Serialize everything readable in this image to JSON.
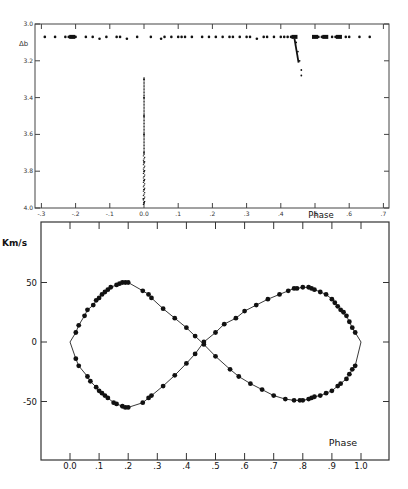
{
  "chart_data": [
    {
      "type": "scatter",
      "title": "",
      "xlabel": "Phase",
      "ylabel": "",
      "y_marker_label": "Δb",
      "xlim": [
        -0.3,
        0.7
      ],
      "ylim": [
        4.0,
        3.0
      ],
      "y_inverted": true,
      "x_ticks": [
        "-.3",
        "-.2",
        "-.1",
        "0.0",
        ".1",
        ".2",
        ".3",
        ".4",
        ".5",
        ".6",
        ".7"
      ],
      "y_ticks": [
        "3.0",
        "3.2",
        "3.4",
        "3.6",
        "3.8",
        "4.0"
      ],
      "grid": false,
      "series": [
        {
          "name": "out-of-eclipse",
          "x": [
            -0.29,
            -0.26,
            -0.23,
            -0.22,
            -0.21,
            -0.2,
            -0.17,
            -0.15,
            -0.13,
            -0.11,
            -0.08,
            -0.07,
            -0.05,
            -0.02,
            0.02,
            0.05,
            0.06,
            0.08,
            0.1,
            0.11,
            0.12,
            0.14,
            0.17,
            0.19,
            0.21,
            0.23,
            0.25,
            0.26,
            0.28,
            0.3,
            0.31,
            0.33,
            0.35,
            0.36,
            0.38,
            0.4,
            0.41,
            0.42,
            0.43,
            0.44,
            0.5,
            0.51,
            0.52,
            0.55,
            0.56,
            0.59,
            0.6,
            0.63,
            0.66
          ],
          "y": [
            3.07,
            3.07,
            3.07,
            3.07,
            3.07,
            3.07,
            3.07,
            3.07,
            3.08,
            3.07,
            3.07,
            3.07,
            3.08,
            3.07,
            3.07,
            3.08,
            3.07,
            3.07,
            3.07,
            3.07,
            3.07,
            3.07,
            3.07,
            3.07,
            3.07,
            3.07,
            3.07,
            3.07,
            3.07,
            3.07,
            3.07,
            3.08,
            3.07,
            3.07,
            3.07,
            3.07,
            3.07,
            3.07,
            3.07,
            3.07,
            3.07,
            3.07,
            3.07,
            3.07,
            3.07,
            3.07,
            3.07,
            3.07,
            3.07
          ]
        },
        {
          "name": "primary-eclipse",
          "x": [
            0.0,
            0.0,
            0.0,
            0.0,
            0.0,
            0.0,
            0.0,
            0.0,
            0.0,
            -0.002,
            0.0
          ],
          "y": [
            3.3,
            3.4,
            3.5,
            3.6,
            3.7,
            3.75,
            3.8,
            3.85,
            3.9,
            3.95,
            3.97
          ]
        },
        {
          "name": "secondary-eclipse",
          "x": [
            0.445,
            0.45,
            0.455,
            0.46,
            0.46
          ],
          "y": [
            3.1,
            3.15,
            3.2,
            3.25,
            3.28
          ]
        }
      ]
    },
    {
      "type": "line",
      "title": "",
      "xlabel": "Phase",
      "ylabel": "Km/s",
      "xlim": [
        -0.07,
        1.18
      ],
      "ylim": [
        -100,
        85
      ],
      "x_ticks": [
        "0.0",
        ".1",
        ".2",
        ".3",
        ".4",
        ".5",
        ".6",
        ".7",
        ".8",
        ".9",
        "1.0"
      ],
      "y_ticks": [
        "50",
        "0",
        "-50"
      ],
      "grid": false,
      "series": [
        {
          "name": "star 1 (positive first half)",
          "x": [
            0.0,
            0.02,
            0.03,
            0.05,
            0.06,
            0.08,
            0.09,
            0.1,
            0.11,
            0.12,
            0.13,
            0.14,
            0.16,
            0.17,
            0.18,
            0.19,
            0.2,
            0.25,
            0.27,
            0.28,
            0.32,
            0.36,
            0.4,
            0.43,
            0.46,
            0.5,
            0.55,
            0.58,
            0.62,
            0.66,
            0.7,
            0.74,
            0.77,
            0.79,
            0.8,
            0.82,
            0.83,
            0.84,
            0.86,
            0.88,
            0.9,
            0.92,
            0.93,
            0.95,
            0.96,
            0.97,
            0.98,
            1.0
          ],
          "y": [
            0,
            8,
            14,
            22,
            27,
            31,
            35,
            37,
            40,
            42,
            44,
            46,
            48,
            49,
            50,
            50,
            50,
            43,
            40,
            37,
            28,
            20,
            12,
            5,
            -2,
            -12,
            -23,
            -29,
            -35,
            -40,
            -45,
            -48,
            -49,
            -49,
            -49,
            -48,
            -47,
            -46,
            -45,
            -43,
            -41,
            -37,
            -35,
            -31,
            -27,
            -23,
            -20,
            0
          ]
        },
        {
          "name": "star 2 (negative first half)",
          "x": [
            0.0,
            0.02,
            0.03,
            0.06,
            0.07,
            0.09,
            0.1,
            0.11,
            0.12,
            0.13,
            0.15,
            0.16,
            0.18,
            0.19,
            0.2,
            0.25,
            0.27,
            0.28,
            0.32,
            0.36,
            0.4,
            0.43,
            0.46,
            0.5,
            0.53,
            0.57,
            0.6,
            0.64,
            0.68,
            0.72,
            0.75,
            0.77,
            0.78,
            0.8,
            0.82,
            0.83,
            0.84,
            0.86,
            0.88,
            0.9,
            0.91,
            0.92,
            0.93,
            0.94,
            0.95,
            0.96,
            0.97,
            0.98,
            1.0
          ],
          "y": [
            0,
            -14,
            -20,
            -29,
            -33,
            -38,
            -41,
            -43,
            -45,
            -47,
            -51,
            -52,
            -54,
            -55,
            -55,
            -51,
            -47,
            -45,
            -37,
            -28,
            -18,
            -10,
            0,
            8,
            15,
            20,
            26,
            31,
            36,
            40,
            43,
            45,
            45,
            46,
            46,
            45,
            44,
            42,
            40,
            36,
            33,
            30,
            27,
            25,
            22,
            17,
            12,
            8,
            0
          ]
        }
      ]
    }
  ],
  "top_chart": {
    "y_marker_label": "Δb",
    "x_axis_title": "Phase",
    "x_ticks": [
      {
        "v": -0.3,
        "label": "-.3"
      },
      {
        "v": -0.2,
        "label": "-.2"
      },
      {
        "v": -0.1,
        "label": "-.1"
      },
      {
        "v": 0.0,
        "label": "0.0"
      },
      {
        "v": 0.1,
        "label": ".1"
      },
      {
        "v": 0.2,
        "label": ".2"
      },
      {
        "v": 0.3,
        "label": ".3"
      },
      {
        "v": 0.4,
        "label": ".4"
      },
      {
        "v": 0.5,
        "label": ".5"
      },
      {
        "v": 0.6,
        "label": ".6"
      },
      {
        "v": 0.7,
        "label": ".7"
      }
    ],
    "y_ticks": [
      {
        "v": 3.0,
        "label": "3.0"
      },
      {
        "v": 3.2,
        "label": "3.2"
      },
      {
        "v": 3.4,
        "label": "3.4"
      },
      {
        "v": 3.6,
        "label": "3.6"
      },
      {
        "v": 3.8,
        "label": "3.8"
      },
      {
        "v": 4.0,
        "label": "4.0"
      }
    ]
  },
  "bottom_chart": {
    "y_axis_title": "Km/s",
    "x_axis_title": "Phase",
    "x_ticks": [
      {
        "v": 0.0,
        "label": "0.0"
      },
      {
        "v": 0.1,
        "label": ".1"
      },
      {
        "v": 0.2,
        "label": ".2"
      },
      {
        "v": 0.3,
        "label": ".3"
      },
      {
        "v": 0.4,
        "label": ".4"
      },
      {
        "v": 0.5,
        "label": ".5"
      },
      {
        "v": 0.6,
        "label": ".6"
      },
      {
        "v": 0.7,
        "label": ".7"
      },
      {
        "v": 0.8,
        "label": ".8"
      },
      {
        "v": 0.9,
        "label": ".9"
      },
      {
        "v": 1.0,
        "label": "1.0"
      }
    ],
    "y_ticks": [
      {
        "v": 50,
        "label": "50"
      },
      {
        "v": 0,
        "label": "0"
      },
      {
        "v": -50,
        "label": "-50"
      }
    ]
  }
}
